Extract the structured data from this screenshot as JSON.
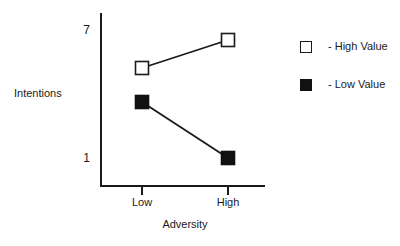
{
  "chart_data": {
    "type": "line",
    "title": "",
    "xlabel": "Adversity",
    "ylabel": "Intentions",
    "categories": [
      "Low",
      "High"
    ],
    "x_tick_labels": [
      "Low",
      "High"
    ],
    "y_tick_labels": [
      "7",
      "1"
    ],
    "ylim": [
      1,
      7
    ],
    "grid": false,
    "legend_position": "right",
    "series": [
      {
        "name": "High Value",
        "legend_label": "- High Value",
        "marker": "open-square",
        "marker_color": "#ffffff",
        "marker_edge_color": "#1a1a1a",
        "line_color": "#1a1a1a",
        "values": [
          5.1,
          6.7
        ],
        "points": [
          {
            "x": "Low",
            "y": 5.1,
            "px": 142,
            "py": 68
          },
          {
            "x": "High",
            "y": 6.7,
            "px": 228,
            "py": 40
          }
        ]
      },
      {
        "name": "Low Value",
        "legend_label": "- Low Value",
        "marker": "filled-square",
        "marker_color": "#111111",
        "marker_edge_color": "#111111",
        "line_color": "#1a1a1a",
        "values": [
          3.4,
          1.1
        ],
        "points": [
          {
            "x": "Low",
            "y": 3.4,
            "px": 142,
            "py": 102
          },
          {
            "x": "High",
            "y": 1.1,
            "px": 228,
            "py": 158
          }
        ]
      }
    ]
  },
  "axes": {
    "y_title": "Intentions",
    "x_title": "Adversity",
    "y_tick_top": "7",
    "y_tick_bottom": "1",
    "x_tick_left": "Low",
    "x_tick_right": "High"
  },
  "legend": {
    "entries": [
      {
        "label": "- High Value",
        "swatch": "open-square"
      },
      {
        "label": "- Low Value",
        "swatch": "filled-square"
      }
    ]
  }
}
